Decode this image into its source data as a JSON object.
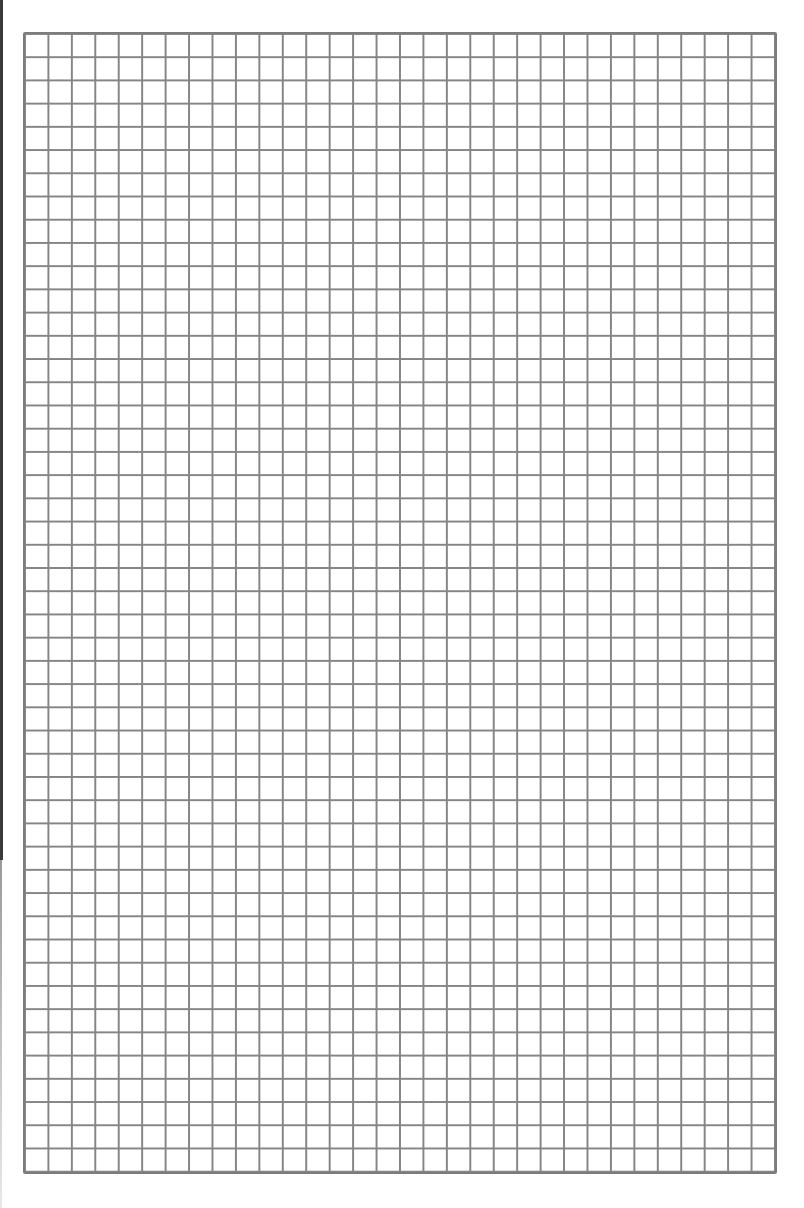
{
  "page": {
    "type": "graph-paper",
    "grid": {
      "columns": 32,
      "rows": 49,
      "line_color": "#858585",
      "background_color": "#ffffff"
    },
    "edge_line_color": "#3a3a3a"
  }
}
